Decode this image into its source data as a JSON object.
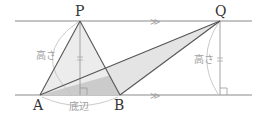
{
  "diagram": {
    "type": "geometry",
    "points": {
      "P": {
        "label": "P",
        "x": 80,
        "y": 21
      },
      "Q": {
        "label": "Q",
        "x": 220,
        "y": 21
      },
      "A": {
        "label": "A",
        "x": 40,
        "y": 95
      },
      "B": {
        "label": "B",
        "x": 120,
        "y": 95
      }
    },
    "labels": {
      "height_left": "高さ",
      "height_right": "高さ",
      "base": "底辺"
    },
    "parallel_lines": {
      "top_y": 21,
      "bottom_y": 95,
      "marker": "≫"
    },
    "colors": {
      "line": "#555555",
      "parallel_line": "#8a8a8a",
      "triangle_pab_fill": "#ececec",
      "triangle_qab_fill": "#e2e2e2",
      "overlap_fill": "#c8c8c8",
      "annotation": "#b0b0b0"
    }
  }
}
